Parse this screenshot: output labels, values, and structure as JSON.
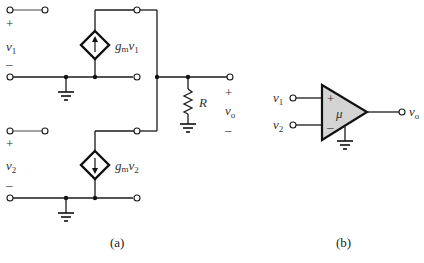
{
  "figure_a": {
    "caption": "(a)",
    "input1": {
      "label": "v",
      "sub": "1",
      "plus": "+",
      "minus": "–"
    },
    "input2": {
      "label": "v",
      "sub": "2",
      "plus": "+",
      "minus": "–"
    },
    "source1": {
      "label_g": "g",
      "label_m": "m",
      "label_v": "v",
      "label_sub": "1",
      "direction": "up"
    },
    "source2": {
      "label_g": "g",
      "label_m": "m",
      "label_v": "v",
      "label_sub": "2",
      "direction": "down"
    },
    "resistor": {
      "label": "R"
    },
    "output": {
      "label": "v",
      "sub": "o",
      "plus": "+",
      "minus": "–"
    }
  },
  "figure_b": {
    "caption": "(b)",
    "input1": {
      "label": "v",
      "sub": "1"
    },
    "input2": {
      "label": "v",
      "sub": "2"
    },
    "plus_sign": "+",
    "minus_sign": "–",
    "gain": "μ",
    "output": {
      "label": "v",
      "sub": "o"
    },
    "fill_color": "#d4d4d4"
  }
}
